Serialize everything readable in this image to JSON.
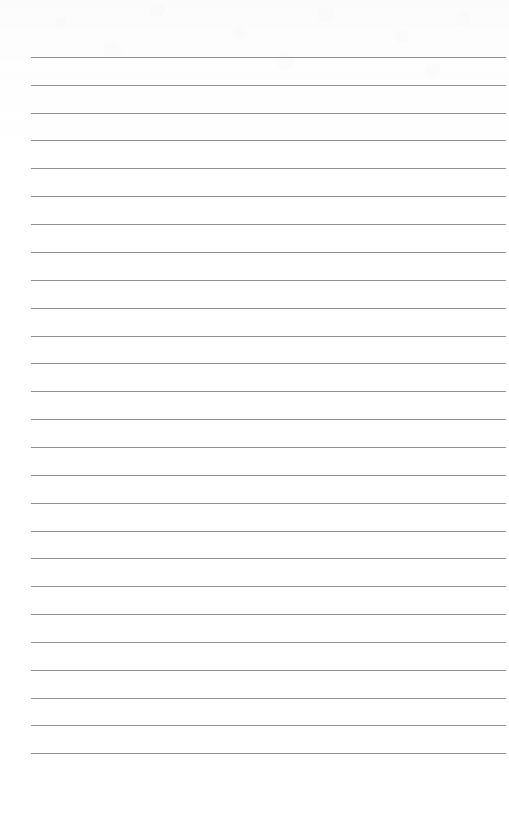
{
  "document": {
    "kind": "scanned-lined-paper",
    "title": "Lined notebook page",
    "page_width": 509,
    "page_height": 828,
    "background_color": "#ffffff",
    "visible_text": "",
    "handwriting_present": "none",
    "content_note": "Blank ruled page — no written text, no headings, no page number."
  },
  "ruling": {
    "line_color": "#8e9195",
    "line_thickness_px": 1,
    "line_count": 26,
    "first_line_y": 57,
    "line_spacing_px": 27.84,
    "left_margin_x": 31,
    "right_edge_x": 506,
    "line_length_px": 475,
    "top_blank_margin_px": 57,
    "bottom_blank_margin_px": 75,
    "margin_rule_present": "none"
  },
  "texture": {
    "top_mottling_color": "#969ba5",
    "top_mottling_height_px": 160,
    "note": "faint grayish scan mottling across the upper blank band"
  },
  "lines": [
    {
      "index": 1,
      "y": 57
    },
    {
      "index": 2,
      "y": 85
    },
    {
      "index": 3,
      "y": 113
    },
    {
      "index": 4,
      "y": 140
    },
    {
      "index": 5,
      "y": 168
    },
    {
      "index": 6,
      "y": 196
    },
    {
      "index": 7,
      "y": 224
    },
    {
      "index": 8,
      "y": 252
    },
    {
      "index": 9,
      "y": 280
    },
    {
      "index": 10,
      "y": 308
    },
    {
      "index": 11,
      "y": 336
    },
    {
      "index": 12,
      "y": 363
    },
    {
      "index": 13,
      "y": 391
    },
    {
      "index": 14,
      "y": 419
    },
    {
      "index": 15,
      "y": 447
    },
    {
      "index": 16,
      "y": 475
    },
    {
      "index": 17,
      "y": 503
    },
    {
      "index": 18,
      "y": 531
    },
    {
      "index": 19,
      "y": 558
    },
    {
      "index": 20,
      "y": 586
    },
    {
      "index": 21,
      "y": 614
    },
    {
      "index": 22,
      "y": 642
    },
    {
      "index": 23,
      "y": 670
    },
    {
      "index": 24,
      "y": 698
    },
    {
      "index": 25,
      "y": 725
    },
    {
      "index": 26,
      "y": 753
    }
  ]
}
